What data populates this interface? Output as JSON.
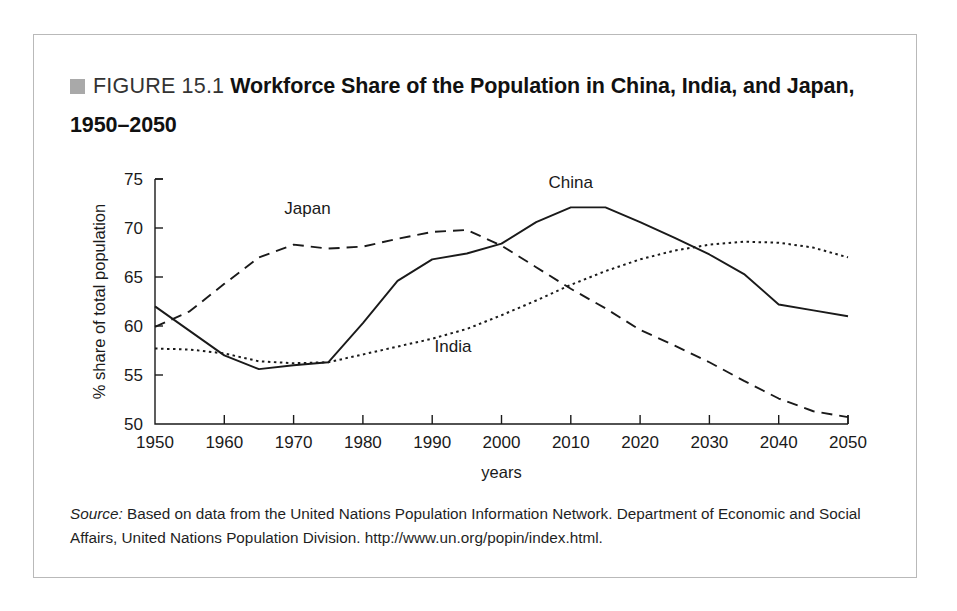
{
  "figure": {
    "bullet_color": "#a9a9a9",
    "label": "FIGURE 15.1",
    "caption": "Workforce Share of the Population in China, India, and Japan, 1950–2050"
  },
  "source": {
    "prefix": "Source:",
    "text": " Based on data from the United Nations Population Information Network. Department of Economic and Social Affairs, United Nations Population Division. http://www.un.org/popin/index.html."
  },
  "chart_data": {
    "type": "line",
    "title": "Workforce Share of the Population in China, India, and Japan, 1950–2050",
    "xlabel": "years",
    "ylabel": "% share of total population",
    "xlim": [
      1950,
      2050
    ],
    "ylim": [
      50,
      75
    ],
    "xticks": [
      1950,
      1960,
      1970,
      1980,
      1990,
      2000,
      2010,
      2020,
      2030,
      2040,
      2050
    ],
    "yticks": [
      50,
      55,
      60,
      65,
      70,
      75
    ],
    "xtick_labels": [
      "1950",
      "1960",
      "1970",
      "1980",
      "1990",
      "2000",
      "2010",
      "2020",
      "2030",
      "2040",
      "2050"
    ],
    "ytick_labels": [
      "50",
      "55",
      "60",
      "65",
      "70",
      "75"
    ],
    "grid": false,
    "legend": "inline-labels",
    "x": [
      1950,
      1955,
      1960,
      1965,
      1970,
      1975,
      1980,
      1985,
      1990,
      1995,
      2000,
      2005,
      2010,
      2015,
      2020,
      2025,
      2030,
      2035,
      2040,
      2045,
      2050
    ],
    "series": [
      {
        "name": "China",
        "style": "solid",
        "color": "#1a1a1a",
        "label_x": 2010,
        "label_y": 74.1,
        "values": [
          62.0,
          59.5,
          57.0,
          55.6,
          56.0,
          56.3,
          60.3,
          64.6,
          66.8,
          67.4,
          68.4,
          70.6,
          72.1,
          72.1,
          70.6,
          69.0,
          67.3,
          65.3,
          62.2,
          61.6,
          61.0
        ]
      },
      {
        "name": "India",
        "style": "dotted",
        "color": "#1a1a1a",
        "label_x": 1993,
        "label_y": 57.3,
        "values": [
          57.7,
          57.6,
          57.2,
          56.4,
          56.2,
          56.3,
          57.1,
          57.9,
          58.7,
          59.7,
          61.1,
          62.6,
          64.2,
          65.6,
          66.8,
          67.7,
          68.3,
          68.6,
          68.5,
          68.0,
          67.0
        ]
      },
      {
        "name": "Japan",
        "style": "dashed",
        "color": "#1a1a1a",
        "label_x": 1972,
        "label_y": 71.4,
        "values": [
          59.9,
          61.5,
          64.3,
          67.0,
          68.3,
          67.9,
          68.1,
          68.9,
          69.6,
          69.8,
          68.2,
          66.0,
          63.8,
          61.8,
          59.6,
          58.0,
          56.3,
          54.4,
          52.6,
          51.3,
          50.7
        ]
      }
    ]
  }
}
